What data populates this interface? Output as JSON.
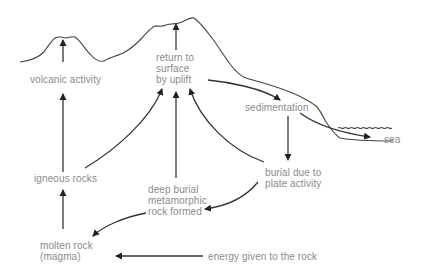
{
  "labels": {
    "volcanic_activity": "volcanic activity",
    "return_to_surface": [
      "return to",
      "surface",
      "by uplift"
    ],
    "sedimentation": "sedimentation",
    "sea": "sea",
    "igneous_rocks": "igneous rocks",
    "deep_burial": [
      "deep burial",
      "metamorphic",
      "rock formed"
    ],
    "burial_plate": [
      "burial due to",
      "plate activity"
    ],
    "molten_rock": [
      "molten rock",
      "(magma)"
    ],
    "energy": "energy given to the rock"
  },
  "colors": {
    "text": "#8a8a8a",
    "lines": "#333333",
    "background": "#ffffff"
  },
  "edges": [
    {
      "from": "igneous rocks",
      "to": "volcanic activity"
    },
    {
      "from": "molten rock (magma)",
      "to": "igneous rocks"
    },
    {
      "from": "igneous rocks",
      "to": "return to surface by uplift"
    },
    {
      "from": "deep burial metamorphic rock formed",
      "to": "return to surface by uplift"
    },
    {
      "from": "burial due to plate activity",
      "to": "return to surface by uplift"
    },
    {
      "from": "return to surface by uplift",
      "to": "sedimentation"
    },
    {
      "from": "sedimentation",
      "to": "sea"
    },
    {
      "from": "sedimentation",
      "to": "burial due to plate activity"
    },
    {
      "from": "burial due to plate activity",
      "to": "deep burial metamorphic rock formed"
    },
    {
      "from": "deep burial metamorphic rock formed",
      "to": "molten rock (magma)"
    },
    {
      "from": "energy given to the rock",
      "to": "molten rock (magma)"
    }
  ]
}
